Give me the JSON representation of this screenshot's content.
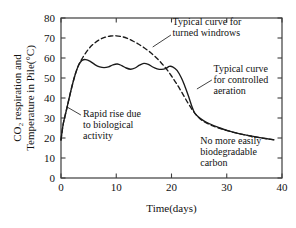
{
  "chart_data": {
    "type": "line",
    "title": "",
    "xlabel": "Time(days)",
    "ylabel_line1": "CO₂ respiration and",
    "ylabel_line2": "Temperature in Pile(°C)",
    "xlim": [
      0,
      40
    ],
    "ylim": [
      0,
      80
    ],
    "xticks": [
      0,
      10,
      20,
      30,
      40
    ],
    "yticks": [
      0,
      10,
      20,
      30,
      40,
      50,
      60,
      70,
      80
    ],
    "xtick_labels": [
      "0",
      "10",
      "20",
      "30",
      "40"
    ],
    "ytick_labels": [
      "0",
      "10",
      "20",
      "30",
      "40",
      "50",
      "60",
      "70",
      "80"
    ],
    "grid": false,
    "legend": "none",
    "series": [
      {
        "name": "Typical curve for controlled aeration",
        "style": "solid",
        "color": "#1a1a1a",
        "x": [
          0,
          0.4,
          0.9,
          1.4,
          2.0,
          2.6,
          3.2,
          3.8,
          4.5,
          5.3,
          6.2,
          7.0,
          7.8,
          8.6,
          9.4,
          10.2,
          11.0,
          11.8,
          12.6,
          13.4,
          14.2,
          15.0,
          15.8,
          16.6,
          17.4,
          18.2,
          19.0,
          19.6,
          20.2,
          21.0,
          21.8,
          22.4,
          23.0,
          23.6,
          24.2,
          25.0,
          26.0,
          27.0,
          28.5,
          30.0,
          32.0,
          34.0,
          36.0,
          38.5
        ],
        "y": [
          19,
          27,
          33,
          39,
          46,
          52,
          56.5,
          58.8,
          59.2,
          58.3,
          56.6,
          55.6,
          55.2,
          55.6,
          56.6,
          57.0,
          56.2,
          55.0,
          54.4,
          55.0,
          56.4,
          57.3,
          56.8,
          55.5,
          54.6,
          54.3,
          54.8,
          55.8,
          55.6,
          53.8,
          50.0,
          46.0,
          41.5,
          36.5,
          32.5,
          30.2,
          28.3,
          27.0,
          25.3,
          23.8,
          22.3,
          21.2,
          20.2,
          19.1
        ]
      },
      {
        "name": "Typical curve for turned windrows",
        "style": "dashed",
        "color": "#1a1a1a",
        "x": [
          0,
          0.4,
          0.9,
          1.4,
          2.0,
          2.6,
          3.2,
          4.0,
          5.0,
          6.0,
          7.0,
          8.0,
          9.0,
          10.0,
          11.0,
          12.0,
          13.0,
          14.0,
          15.0,
          16.0,
          17.0,
          18.0,
          19.0,
          20.0,
          21.0,
          22.0,
          23.0,
          24.0,
          25.0,
          26.0,
          27.5,
          29.0,
          31.0,
          33.0,
          35.0,
          37.0,
          38.5
        ],
        "y": [
          19,
          27,
          33,
          39,
          46,
          52,
          56.5,
          60.5,
          64.5,
          67.3,
          69.2,
          70.4,
          71.0,
          71.1,
          70.7,
          69.8,
          68.5,
          67.0,
          65.2,
          63.2,
          60.8,
          58.0,
          54.8,
          51.0,
          46.8,
          42.2,
          37.4,
          33.2,
          30.0,
          28.0,
          26.0,
          24.6,
          23.0,
          21.7,
          20.6,
          19.7,
          19.2
        ]
      }
    ],
    "annotations": [
      {
        "id": "rapid-rise",
        "lines": [
          "Rapid rise due",
          "to biological",
          "activity"
        ],
        "text_x": 4.0,
        "text_y": 30.5,
        "leader_from_x": 3.6,
        "leader_from_y": 31.5,
        "leader_to_x": 1.1,
        "leader_to_y": 35.5
      },
      {
        "id": "turned-windrows",
        "lines": [
          "Typical curve for",
          "turned windrows"
        ],
        "text_x": 20.2,
        "text_y": 76.5,
        "leader_from_x": 19.9,
        "leader_from_y": 71.5,
        "leader_to_x": 16.6,
        "leader_to_y": 65.5
      },
      {
        "id": "controlled-aeration",
        "lines": [
          "Typical curve",
          "for controlled",
          "aeration"
        ],
        "text_x": 27.6,
        "text_y": 53.0,
        "leader_from_x": 27.3,
        "leader_from_y": 49.0,
        "leader_to_x": 24.6,
        "leader_to_y": 44.5
      },
      {
        "id": "no-more-carbon",
        "lines": [
          "No more easily",
          "biodegradable",
          "carbon"
        ],
        "text_x": 25.2,
        "text_y": 17.0,
        "leader_from_x": null,
        "leader_from_y": null,
        "leader_to_x": null,
        "leader_to_y": null
      }
    ]
  },
  "colors": {
    "axis": "#3d3d3d",
    "curve": "#1a1a1a",
    "text": "#111111",
    "background": "#ffffff"
  }
}
